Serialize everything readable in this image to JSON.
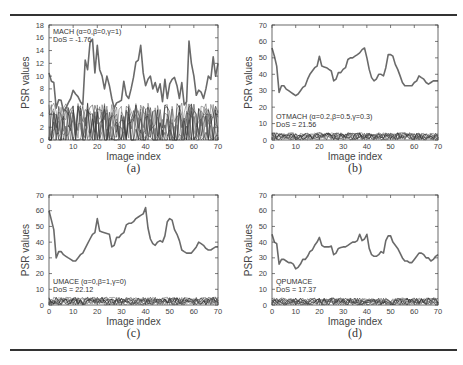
{
  "figure": {
    "top_rule": true,
    "bottom_rule": true
  },
  "chart_data": [
    {
      "id": "a",
      "type": "line",
      "caption": "(a)",
      "xlabel": "Image index",
      "ylabel": "PSR values",
      "xlim": [
        0,
        70
      ],
      "ylim": [
        0,
        18
      ],
      "xticks": [
        0,
        10,
        20,
        30,
        40,
        50,
        60,
        70
      ],
      "yticks": [
        0,
        2,
        4,
        6,
        8,
        10,
        12,
        14,
        16,
        18
      ],
      "legend": [
        "MACH (α=0,β=0,γ=1)",
        "DoS = -1.76"
      ],
      "legend_position": "top-left",
      "series": [
        {
          "name": "authentic",
          "style": "thick-gray",
          "x": [
            0,
            1,
            2,
            3,
            4,
            5,
            6,
            7,
            8,
            9,
            10,
            11,
            12,
            13,
            14,
            15,
            16,
            17,
            18,
            19,
            20,
            21,
            22,
            23,
            24,
            25,
            26,
            27,
            28,
            29,
            30,
            31,
            32,
            33,
            34,
            35,
            36,
            37,
            38,
            39,
            40,
            41,
            42,
            43,
            44,
            45,
            46,
            47,
            48,
            49,
            50,
            51,
            52,
            53,
            54,
            55,
            56,
            57,
            58,
            59,
            60,
            61,
            62,
            63,
            64,
            65,
            66,
            67,
            68,
            69,
            70
          ],
          "values": [
            10.5,
            9.2,
            9.0,
            5.0,
            6.3,
            6.2,
            4.5,
            5.0,
            5.8,
            6.5,
            7.8,
            7.2,
            6.8,
            6.0,
            5.5,
            12.5,
            11.0,
            15.2,
            15.8,
            10.5,
            14.8,
            11.0,
            10.0,
            8.0,
            10.0,
            8.5,
            6.5,
            5.0,
            5.8,
            6.0,
            6.2,
            9.2,
            7.0,
            6.5,
            8.0,
            9.8,
            12.2,
            12.5,
            14.8,
            10.5,
            8.5,
            9.5,
            10.0,
            8.0,
            9.0,
            7.5,
            8.8,
            6.0,
            9.5,
            6.5,
            8.8,
            9.5,
            9.8,
            8.5,
            6.5,
            9.0,
            5.5,
            6.0,
            15.5,
            12.0,
            10.0,
            7.0,
            7.8,
            7.5,
            6.5,
            8.0,
            10.0,
            9.5,
            13.0,
            10.0,
            12.0
          ]
        },
        {
          "name": "impostors",
          "style": "thin-noise",
          "band": [
            0,
            5.8
          ]
        }
      ]
    },
    {
      "id": "b",
      "type": "line",
      "caption": "(b)",
      "xlabel": "Image index",
      "ylabel": "PSR values",
      "xlim": [
        0,
        70
      ],
      "ylim": [
        0,
        70
      ],
      "xticks": [
        0,
        10,
        20,
        30,
        40,
        50,
        60,
        70
      ],
      "yticks": [
        0,
        10,
        20,
        30,
        40,
        50,
        60,
        70
      ],
      "legend": [
        "OTMACH (α=0.2,β=0.5,γ=0.3)",
        "DoS = 21.56"
      ],
      "legend_position": "bottom-left",
      "series": [
        {
          "name": "authentic",
          "style": "thick-gray",
          "x": [
            0,
            1,
            2,
            3,
            4,
            5,
            6,
            7,
            8,
            9,
            10,
            11,
            12,
            13,
            14,
            15,
            16,
            17,
            18,
            19,
            20,
            21,
            22,
            23,
            24,
            25,
            26,
            27,
            28,
            29,
            30,
            31,
            32,
            33,
            34,
            35,
            36,
            37,
            38,
            39,
            40,
            41,
            42,
            43,
            44,
            45,
            46,
            47,
            48,
            49,
            50,
            51,
            52,
            53,
            54,
            55,
            56,
            57,
            58,
            59,
            60,
            61,
            62,
            63,
            64,
            65,
            66,
            67,
            68,
            69,
            70
          ],
          "values": [
            56,
            51,
            45,
            29,
            33,
            33,
            31,
            30,
            29,
            28,
            27,
            28,
            30,
            32,
            33,
            37,
            40,
            42,
            44,
            45,
            51,
            45,
            44.5,
            44,
            43,
            42,
            36,
            37,
            41,
            41,
            43,
            44,
            49,
            50,
            50,
            51,
            52,
            53,
            55,
            56,
            50,
            43,
            38,
            36,
            37,
            40,
            40,
            39,
            44,
            52,
            52,
            51,
            46,
            43,
            39,
            35,
            33,
            33,
            33,
            33,
            35,
            36,
            39,
            38,
            37,
            35,
            34,
            35,
            36,
            36,
            36
          ]
        },
        {
          "name": "impostors",
          "style": "thin-noise",
          "band": [
            0,
            4.5
          ]
        }
      ]
    },
    {
      "id": "c",
      "type": "line",
      "caption": "(c)",
      "xlabel": "Image index",
      "ylabel": "PSR values",
      "xlim": [
        0,
        70
      ],
      "ylim": [
        0,
        70
      ],
      "xticks": [
        0,
        10,
        20,
        30,
        40,
        50,
        60,
        70
      ],
      "yticks": [
        0,
        10,
        20,
        30,
        40,
        50,
        60,
        70
      ],
      "legend": [
        "UMACE (α=0,β=1,γ=0)",
        "DoS = 22.12"
      ],
      "legend_position": "bottom-left",
      "series": [
        {
          "name": "authentic",
          "style": "thick-gray",
          "x": [
            0,
            1,
            2,
            3,
            4,
            5,
            6,
            7,
            8,
            9,
            10,
            11,
            12,
            13,
            14,
            15,
            16,
            17,
            18,
            19,
            20,
            21,
            22,
            23,
            24,
            25,
            26,
            27,
            28,
            29,
            30,
            31,
            32,
            33,
            34,
            35,
            36,
            37,
            38,
            39,
            40,
            41,
            42,
            43,
            44,
            45,
            46,
            47,
            48,
            49,
            50,
            51,
            52,
            53,
            54,
            55,
            56,
            57,
            58,
            59,
            60,
            61,
            62,
            63,
            64,
            65,
            66,
            67,
            68,
            69,
            70
          ],
          "values": [
            60,
            54,
            48,
            30,
            34,
            34,
            32,
            31,
            30,
            29,
            28,
            28,
            30,
            32,
            33,
            36,
            39,
            42,
            45,
            46,
            55,
            47,
            46.5,
            46,
            45.5,
            45,
            37,
            38,
            43,
            43,
            45,
            46,
            51,
            52,
            52,
            53,
            55,
            56,
            57,
            58,
            62,
            49,
            42,
            39,
            38,
            40,
            41,
            40,
            44,
            53,
            55,
            54,
            48,
            45,
            41,
            35,
            34,
            33,
            33,
            33,
            35,
            37,
            40,
            39,
            38,
            36,
            35,
            35,
            36,
            37,
            37
          ]
        },
        {
          "name": "impostors",
          "style": "thin-noise",
          "band": [
            0,
            5
          ]
        }
      ]
    },
    {
      "id": "d",
      "type": "line",
      "caption": "(d)",
      "xlabel": "Image index",
      "ylabel": "PSR values",
      "xlim": [
        0,
        70
      ],
      "ylim": [
        0,
        70
      ],
      "xticks": [
        0,
        10,
        20,
        30,
        40,
        50,
        60,
        70
      ],
      "yticks": [
        0,
        10,
        20,
        30,
        40,
        50,
        60,
        70
      ],
      "legend": [
        "QPUMACE",
        "DoS = 17.37"
      ],
      "legend_position": "bottom-left",
      "series": [
        {
          "name": "authentic",
          "style": "thick-gray",
          "x": [
            0,
            1,
            2,
            3,
            4,
            5,
            6,
            7,
            8,
            9,
            10,
            11,
            12,
            13,
            14,
            15,
            16,
            17,
            18,
            19,
            20,
            21,
            22,
            23,
            24,
            25,
            26,
            27,
            28,
            29,
            30,
            31,
            32,
            33,
            34,
            35,
            36,
            37,
            38,
            39,
            40,
            41,
            42,
            43,
            44,
            45,
            46,
            47,
            48,
            49,
            50,
            51,
            52,
            53,
            54,
            55,
            56,
            57,
            58,
            59,
            60,
            61,
            62,
            63,
            64,
            65,
            66,
            67,
            68,
            69,
            70
          ],
          "values": [
            45,
            40,
            39,
            26,
            29,
            29,
            28,
            27,
            27,
            26,
            23,
            24,
            26,
            29,
            29,
            31,
            34,
            35,
            38,
            40,
            43,
            38,
            37,
            37,
            37,
            37.5,
            32,
            33,
            36,
            36.5,
            37,
            37,
            38,
            39,
            40,
            40,
            41,
            45,
            41,
            42,
            45,
            36,
            32,
            31,
            31,
            32,
            34,
            33,
            41,
            44,
            44,
            40,
            38,
            36,
            33,
            30,
            28,
            28,
            27,
            27,
            29,
            31,
            33,
            33,
            32,
            30,
            30,
            28,
            29,
            31,
            32
          ]
        },
        {
          "name": "impostors",
          "style": "thin-noise",
          "band": [
            0,
            4.5
          ]
        }
      ]
    }
  ]
}
